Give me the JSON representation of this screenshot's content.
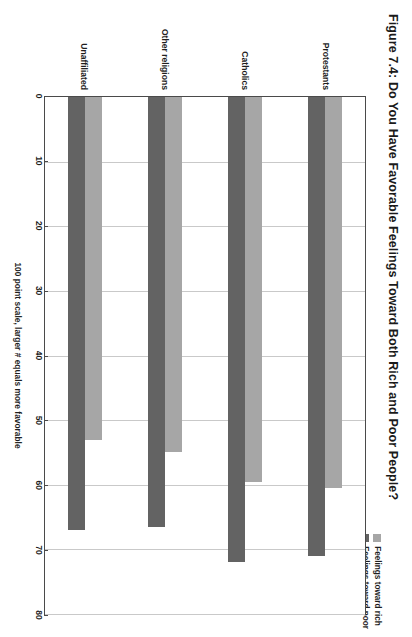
{
  "figure": {
    "title": "Figure 7.4: Do You Have Favorable Feelings Toward Both Rich and Poor People?"
  },
  "legend": {
    "position": "top-right",
    "entries": [
      {
        "label": "Feelings toward rich",
        "color": "#a6a6a6",
        "swatch_name": "legend-swatch-rich"
      },
      {
        "label": "Feelings toward poor",
        "color": "#636363",
        "swatch_name": "legend-swatch-poor"
      }
    ]
  },
  "axes": {
    "value_axis_label": "100 point scale, larger # equals more favorable",
    "value_ticks": [
      "0",
      "10",
      "20",
      "30",
      "40",
      "50",
      "60",
      "70",
      "80"
    ],
    "category_labels": [
      "Protestants",
      "Catholics",
      "Other religions",
      "Unaffiliated"
    ]
  },
  "chart_data": {
    "type": "bar",
    "orientation": "horizontal",
    "title": "Figure 7.4: Do You Have Favorable Feelings Toward Both Rich and Poor People?",
    "xlabel": "100 point scale, larger # equals more favorable",
    "ylabel": "",
    "xlim": [
      0,
      80
    ],
    "xticks": [
      0,
      10,
      20,
      30,
      40,
      50,
      60,
      70,
      80
    ],
    "grid": true,
    "legend_position": "top-right",
    "categories": [
      "Protestants",
      "Catholics",
      "Other religions",
      "Unaffiliated"
    ],
    "series": [
      {
        "name": "Feelings toward rich",
        "color": "#a6a6a6",
        "values": [
          60.5,
          59.5,
          55.0,
          53.0
        ]
      },
      {
        "name": "Feelings toward poor",
        "color": "#636363",
        "values": [
          71.0,
          72.0,
          66.5,
          67.0
        ]
      }
    ]
  },
  "colors": {
    "rich": "#a6a6a6",
    "poor": "#636363",
    "gridline": "#c9c9c9",
    "axis": "#4a4a4a",
    "text": "#1f1f1f",
    "background": "#ffffff"
  }
}
